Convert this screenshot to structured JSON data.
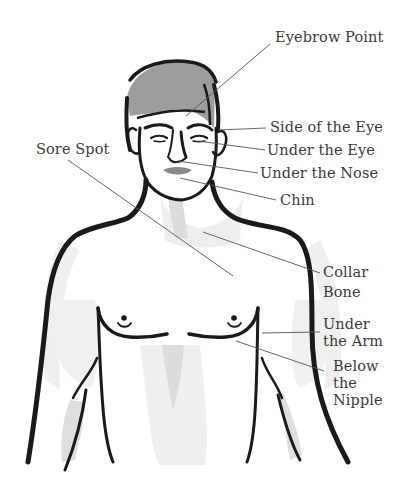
{
  "diagram": {
    "type": "acupressure-tapping-points",
    "labels": [
      {
        "id": "eyebrow-point",
        "text": "Eyebrow Point"
      },
      {
        "id": "side-of-the-eye",
        "text": "Side of the Eye"
      },
      {
        "id": "under-the-eye",
        "text": "Under the Eye"
      },
      {
        "id": "under-the-nose",
        "text": "Under the Nose"
      },
      {
        "id": "chin",
        "text": "Chin"
      },
      {
        "id": "sore-spot",
        "text": "Sore Spot"
      },
      {
        "id": "collar-bone",
        "lines": [
          "Collar",
          "Bone"
        ]
      },
      {
        "id": "under-the-arm",
        "lines": [
          "Under",
          "the Arm"
        ]
      },
      {
        "id": "below-the-nipple",
        "lines": [
          "Below",
          "the",
          "Nipple"
        ]
      }
    ],
    "colors": {
      "outline": "#1a1a1a",
      "hair": "#9a9a9a",
      "lips": "#8a8a8a",
      "shading": "#e6e6e6",
      "leader_line": "#555555",
      "label_text": "#3a3a3a"
    }
  }
}
